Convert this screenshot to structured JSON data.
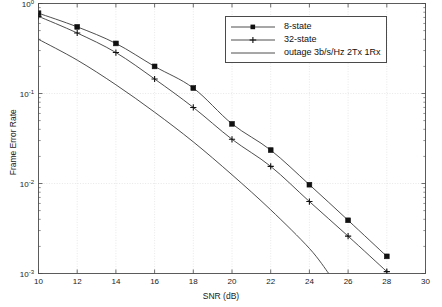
{
  "chart_data": {
    "type": "line",
    "title": "",
    "xlabel": "SNR (dB)",
    "ylabel": "Frame Error Rate",
    "xlim": [
      10,
      30
    ],
    "ylim": [
      0.001,
      1
    ],
    "yscale": "log",
    "xticks": [
      10,
      12,
      14,
      16,
      18,
      20,
      22,
      24,
      26,
      28,
      30
    ],
    "xtick_labels": [
      "10",
      "12",
      "14",
      "16",
      "18",
      "20",
      "22",
      "24",
      "26",
      "28",
      "30"
    ],
    "yticks": [
      1,
      0.1,
      0.01,
      0.001
    ],
    "ytick_labels": [
      "10",
      "10",
      "10",
      "10"
    ],
    "ytick_exponents": [
      "0",
      "-1",
      "-2",
      "-3"
    ],
    "grid": true,
    "legend_position": "upper right",
    "series": [
      {
        "name": "8-state",
        "marker": "square",
        "x": [
          10,
          12,
          14,
          16,
          18,
          20,
          22,
          24,
          26,
          28
        ],
        "values": [
          0.78,
          0.55,
          0.36,
          0.2,
          0.115,
          0.046,
          0.0235,
          0.0097,
          0.0039,
          0.00155
        ]
      },
      {
        "name": "32-state",
        "marker": "plus",
        "x": [
          10,
          12,
          14,
          16,
          18,
          20,
          22,
          24,
          26,
          28
        ],
        "values": [
          0.72,
          0.47,
          0.285,
          0.145,
          0.07,
          0.031,
          0.0155,
          0.0063,
          0.0026,
          0.00105
        ]
      },
      {
        "name": "outage 3b/s/Hz 2Tx 1Rx",
        "marker": "none",
        "x": [
          10,
          12,
          14,
          16,
          18,
          20,
          22,
          24,
          25
        ],
        "values": [
          0.4,
          0.235,
          0.125,
          0.062,
          0.029,
          0.0125,
          0.0051,
          0.0019,
          0.001
        ]
      }
    ]
  },
  "legend": {
    "entries": [
      {
        "label": "8-state"
      },
      {
        "label": "32-state"
      },
      {
        "label": "outage 3b/s/Hz 2Tx 1Rx"
      }
    ]
  },
  "axes": {
    "x_label": "SNR (dB)",
    "y_label": "Frame Error Rate"
  },
  "colors": {
    "axis": "#4a4a4a",
    "grid": "#d8d8d8",
    "series": "#3a3a3a",
    "text": "#1a1a1a"
  }
}
